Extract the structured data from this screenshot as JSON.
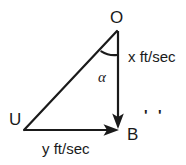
{
  "figure": {
    "stroke_color": "#1a1a1a",
    "background_color": "#ffffff",
    "stroke_width": 2,
    "vertices": [
      {
        "name": "O",
        "label": "O",
        "x": 117,
        "y": 30
      },
      {
        "name": "U",
        "label": "U",
        "x": 24,
        "y": 130
      },
      {
        "name": "B",
        "label": "B",
        "x": 118,
        "y": 130
      }
    ],
    "edges": [
      {
        "name": "hypotenuse-U-to-O",
        "from": "U",
        "to": "O",
        "arrow": false
      },
      {
        "name": "vertical-vector-O-to-B",
        "from": "O",
        "to": "B",
        "arrow": true
      },
      {
        "name": "horizontal-vector-U-to-B",
        "from": "U",
        "to": "B",
        "arrow": true
      }
    ],
    "angle": {
      "name": "alpha-at-O",
      "label": "α",
      "at_vertex": "O",
      "arc_radius": 26
    },
    "edge_labels": {
      "vertical": "x ft/sec",
      "horizontal": "y ft/sec"
    },
    "marks": {
      "after_B": [
        "'",
        "'"
      ]
    }
  }
}
